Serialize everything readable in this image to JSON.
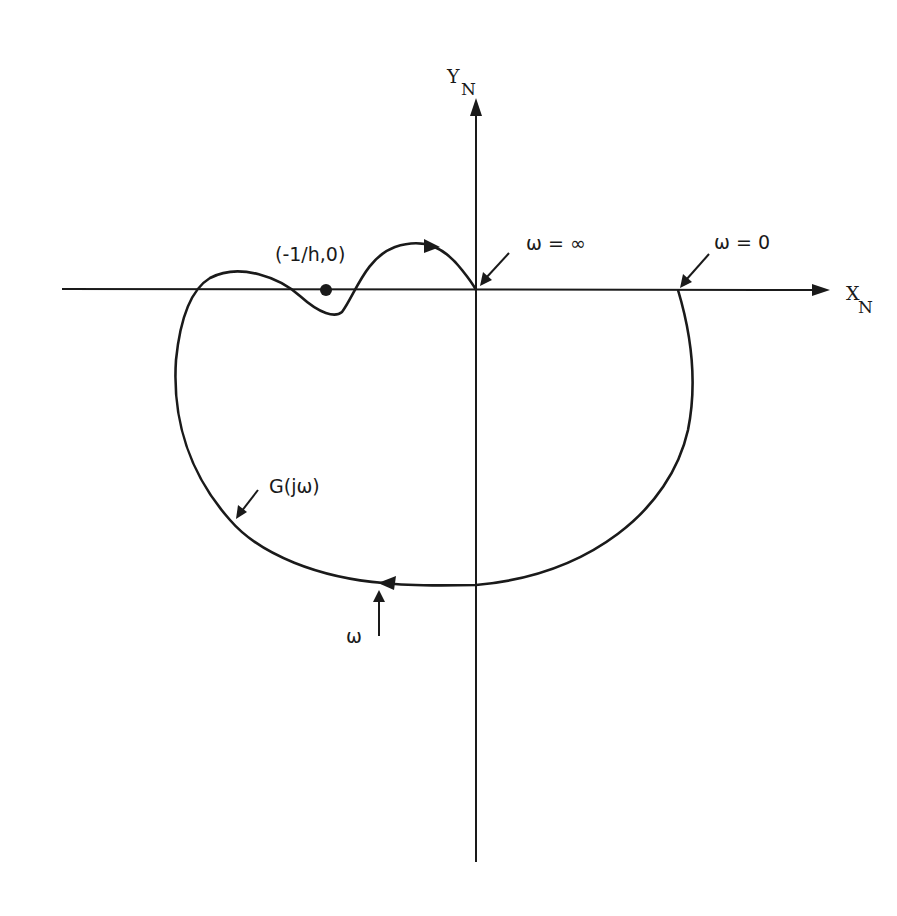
{
  "diagram": {
    "type": "nyquist-plot",
    "axes": {
      "x_label": "X",
      "x_subscript": "N",
      "y_label": "Y",
      "y_subscript": "N"
    },
    "critical_point": {
      "label": "(-1/h,0)"
    },
    "annotations": {
      "omega_infinity": "ω  =  ∞",
      "omega_zero": "ω  =  0",
      "curve_label": "G(jω)",
      "omega_direction": "ω"
    },
    "colors": {
      "ink": "#1a1a1a",
      "background": "#ffffff"
    }
  }
}
